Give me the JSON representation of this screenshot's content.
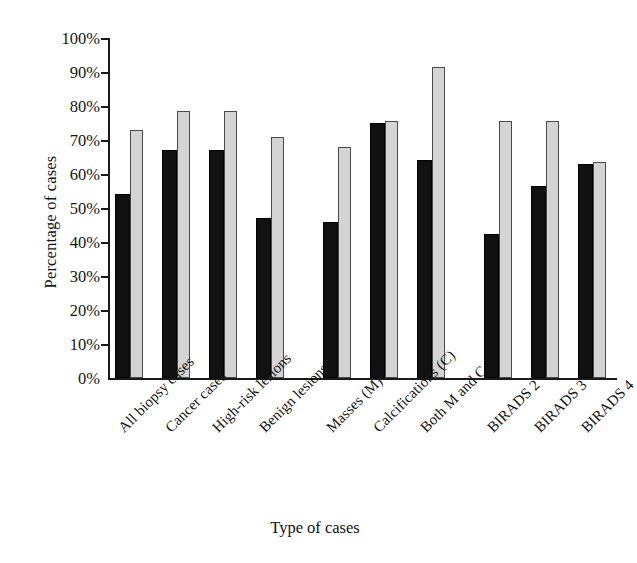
{
  "chart_data": {
    "type": "bar",
    "title": "",
    "xlabel": "Type of cases",
    "ylabel": "Percentage of cases",
    "ylim": [
      0,
      100
    ],
    "yunit": "%",
    "ytick_labels": [
      "100%",
      "90%",
      "80%",
      "70%",
      "60%",
      "50%",
      "40%",
      "30%",
      "20%",
      "10%",
      "0%"
    ],
    "ytick_values": [
      100,
      90,
      80,
      70,
      60,
      50,
      40,
      30,
      20,
      10,
      0
    ],
    "grid": false,
    "legend": "none",
    "groups": [
      {
        "name": "biopsy-group",
        "categories": [
          "All biopsy cases",
          "Cancer cases",
          "High-risk lesions",
          "Benign lesions"
        ],
        "series": [
          {
            "name": "dark",
            "values": [
              54,
              67,
              67,
              47
            ]
          },
          {
            "name": "light",
            "values": [
              73,
              78.5,
              78.5,
              71
            ]
          }
        ]
      },
      {
        "name": "lesion-type-group",
        "categories": [
          "Masses (M)",
          "Calcifications (C)",
          "Both M and C"
        ],
        "series": [
          {
            "name": "dark",
            "values": [
              46,
              75,
              64
            ]
          },
          {
            "name": "light",
            "values": [
              68,
              75.5,
              91.5
            ]
          }
        ]
      },
      {
        "name": "birads-group",
        "categories": [
          "BIRADS 2",
          "BIRADS 3",
          "BIRADS 4"
        ],
        "series": [
          {
            "name": "dark",
            "values": [
              42.5,
              56.5,
              63
            ]
          },
          {
            "name": "light",
            "values": [
              75.5,
              75.5,
              63.5
            ]
          }
        ]
      }
    ],
    "categories": [
      "All biopsy cases",
      "Cancer cases",
      "High-risk lesions",
      "Benign lesions",
      "Masses (M)",
      "Calcifications (C)",
      "Both M and C",
      "BIRADS 2",
      "BIRADS 3",
      "BIRADS 4"
    ],
    "series": [
      {
        "name": "dark",
        "color": "#111111",
        "values": [
          54,
          67,
          67,
          47,
          46,
          75,
          64,
          42.5,
          56.5,
          63
        ]
      },
      {
        "name": "light",
        "color": "#d4d4d4",
        "values": [
          73,
          78.5,
          78.5,
          71,
          68,
          75.5,
          91.5,
          75.5,
          75.5,
          63.5
        ]
      }
    ]
  },
  "axes": {
    "y_title": "Percentage of cases",
    "x_title": "Type of cases"
  },
  "labels": {
    "cat0": "All biopsy cases",
    "cat1": "Cancer cases",
    "cat2": "High-risk lesions",
    "cat3": "Benign lesions",
    "cat4": "Masses (M)",
    "cat5": "Calcifications (C)",
    "cat6": "Both M and C",
    "cat7": "BIRADS 2",
    "cat8": "BIRADS 3",
    "cat9": "BIRADS 4"
  },
  "yticks": {
    "t100": "100%",
    "t90": "90%",
    "t80": "80%",
    "t70": "70%",
    "t60": "60%",
    "t50": "50%",
    "t40": "40%",
    "t30": "30%",
    "t20": "20%",
    "t10": "10%",
    "t0": "0%"
  }
}
